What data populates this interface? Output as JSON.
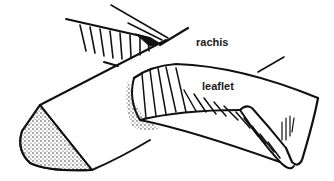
{
  "diagram": {
    "type": "botanical line drawing",
    "labels": [
      {
        "id": "rachis",
        "text": "rachis",
        "x": 196,
        "y": 37
      },
      {
        "id": "leaflet",
        "text": "leaflet",
        "x": 202,
        "y": 81
      }
    ],
    "colors": {
      "ink": "#111111",
      "background": "#ffffff"
    }
  }
}
